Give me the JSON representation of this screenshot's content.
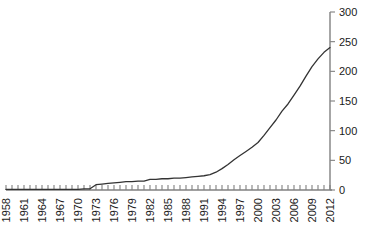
{
  "chart_data": {
    "type": "line",
    "title": "",
    "subtitle": "",
    "xlabel": "",
    "ylabel": "",
    "xlim": [
      1958,
      2012
    ],
    "ylim": [
      0,
      300
    ],
    "grid": false,
    "legend": null,
    "y_axis_position": "right",
    "x_tick_label_rotation": -90,
    "x_tick_interval_minor": 1,
    "x_tick_label_interval": 3,
    "y_tick_interval": 50,
    "line_color": "#333333",
    "axis_color": "#808080",
    "x_tick_labels": [
      "1958",
      "1961",
      "1964",
      "1967",
      "1970",
      "1973",
      "1976",
      "1979",
      "1982",
      "1985",
      "1988",
      "1991",
      "1994",
      "1997",
      "2000",
      "2003",
      "2006",
      "2009",
      "2012"
    ],
    "y_tick_labels": [
      "0",
      "50",
      "100",
      "150",
      "200",
      "250",
      "300"
    ],
    "y_tick_values": [
      0,
      50,
      100,
      150,
      200,
      250,
      300
    ],
    "x": [
      1958,
      1959,
      1960,
      1961,
      1962,
      1963,
      1964,
      1965,
      1966,
      1967,
      1968,
      1969,
      1970,
      1971,
      1972,
      1973,
      1974,
      1975,
      1976,
      1977,
      1978,
      1979,
      1980,
      1981,
      1982,
      1983,
      1984,
      1985,
      1986,
      1987,
      1988,
      1989,
      1990,
      1991,
      1992,
      1993,
      1994,
      1995,
      1996,
      1997,
      1998,
      1999,
      2000,
      2001,
      2002,
      2003,
      2004,
      2005,
      2006,
      2007,
      2008,
      2009,
      2010,
      2011,
      2012
    ],
    "values": [
      1,
      1,
      1,
      1,
      1,
      1,
      1,
      1,
      1,
      1,
      1,
      1,
      1,
      2,
      2,
      9,
      10,
      11,
      12,
      13,
      14,
      14,
      15,
      15,
      18,
      18,
      19,
      19,
      20,
      20,
      21,
      22,
      23,
      24,
      26,
      30,
      36,
      43,
      51,
      58,
      65,
      72,
      80,
      92,
      105,
      118,
      133,
      145,
      160,
      175,
      192,
      208,
      221,
      232,
      240
    ],
    "series": [
      {
        "name": "cumulative-total",
        "values": [
          1,
          1,
          1,
          1,
          1,
          1,
          1,
          1,
          1,
          1,
          1,
          1,
          1,
          2,
          2,
          9,
          10,
          11,
          12,
          13,
          14,
          14,
          15,
          15,
          18,
          18,
          19,
          19,
          20,
          20,
          21,
          22,
          23,
          24,
          26,
          30,
          36,
          43,
          51,
          58,
          65,
          72,
          80,
          92,
          105,
          118,
          133,
          145,
          160,
          175,
          192,
          208,
          221,
          232,
          240
        ]
      }
    ]
  }
}
